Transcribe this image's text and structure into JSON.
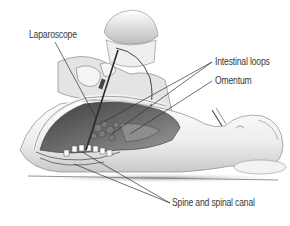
{
  "figure": {
    "labels": {
      "laparoscope": "Laparoscope",
      "intestinal_loops": "Intestinal loops",
      "omentum": "Omentum",
      "spine": "Spine and spinal canal"
    },
    "colors": {
      "line": "#2f2f2f",
      "label_text": "#3a3a3a",
      "cavity_dark": "#555555",
      "body_light": "#f1f1f1",
      "shadow": "#b9b9b9"
    }
  }
}
